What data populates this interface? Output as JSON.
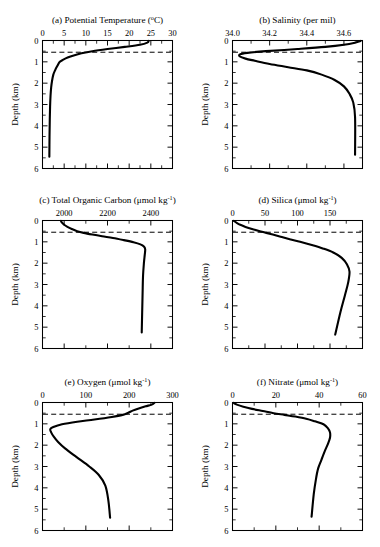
{
  "figure": {
    "axis_label_y": "Depth (km)",
    "depth_unit": "km",
    "depth_ticks": [
      "0",
      "1",
      "2",
      "3",
      "4",
      "5",
      "6"
    ],
    "mixed_layer_dashed_depth_km": 0.55
  },
  "chart_data": [
    {
      "type": "line",
      "panel": "a",
      "title": "(a) Potential Temperature (°C)",
      "title_prefix": "(a) Potential Temperature (",
      "title_unit_base": "o",
      "title_suffix": "C)",
      "xlabel": "Potential Temperature (°C)",
      "ylabel": "Depth (km)",
      "xlim": [
        0,
        30
      ],
      "ylim": [
        6,
        0
      ],
      "xticks": [
        0,
        5,
        10,
        15,
        20,
        25,
        30
      ],
      "xtick_labels": [
        "0",
        "5",
        "10",
        "15",
        "20",
        "25",
        "30"
      ],
      "yticks": [
        0,
        1,
        2,
        3,
        4,
        5,
        6
      ],
      "grid": false,
      "legend": "none",
      "x": [
        24.5,
        24.2,
        22.5,
        19.0,
        15.0,
        11.5,
        9.0,
        7.2,
        5.8,
        4.8,
        4.0,
        3.4,
        2.9,
        2.5,
        2.2,
        2.0,
        1.85,
        1.75,
        1.68,
        1.62,
        1.58
      ],
      "depth_km": [
        0.02,
        0.1,
        0.2,
        0.3,
        0.4,
        0.5,
        0.6,
        0.7,
        0.8,
        0.9,
        1.0,
        1.2,
        1.4,
        1.6,
        1.9,
        2.2,
        2.6,
        3.1,
        3.7,
        4.5,
        5.45
      ]
    },
    {
      "type": "line",
      "panel": "b",
      "title": "(b) Salinity (per mil)",
      "title_prefix": "(b) Salinity (per mil)",
      "xlabel": "Salinity (per mil)",
      "ylabel": "Depth (km)",
      "xlim": [
        34.0,
        34.7
      ],
      "ylim": [
        6,
        0
      ],
      "xticks": [
        34.0,
        34.2,
        34.4,
        34.6
      ],
      "xtick_labels": [
        "34.0",
        "34.2",
        "34.4",
        "34.6"
      ],
      "yticks": [
        0,
        1,
        2,
        3,
        4,
        5,
        6
      ],
      "grid": false,
      "legend": "none",
      "x": [
        34.69,
        34.66,
        34.6,
        34.5,
        34.35,
        34.18,
        34.08,
        34.04,
        34.04,
        34.07,
        34.12,
        34.2,
        34.3,
        34.4,
        34.48,
        34.55,
        34.6,
        34.63,
        34.65,
        34.66,
        34.66
      ],
      "depth_km": [
        0.02,
        0.1,
        0.2,
        0.3,
        0.4,
        0.5,
        0.58,
        0.65,
        0.75,
        0.85,
        0.95,
        1.1,
        1.25,
        1.4,
        1.6,
        1.85,
        2.15,
        2.5,
        2.9,
        3.6,
        5.35
      ]
    },
    {
      "type": "line",
      "panel": "c",
      "title": "(c) Total Organic Carbon (μmol kg⁻¹)",
      "title_prefix": "(c) Total Organic Carbon (μmol kg",
      "title_sup": "-1",
      "title_suffix": ")",
      "xlabel": "Total Organic Carbon (μmol kg⁻¹)",
      "ylabel": "Depth (km)",
      "xlim": [
        1900,
        2500
      ],
      "ylim": [
        6,
        0
      ],
      "xticks": [
        2000,
        2200,
        2400
      ],
      "xtick_labels": [
        "2000",
        "2200",
        "2400"
      ],
      "yticks": [
        0,
        1,
        2,
        3,
        4,
        5,
        6
      ],
      "grid": false,
      "legend": "none",
      "x": [
        1985,
        1990,
        2000,
        2015,
        2035,
        2060,
        2090,
        2130,
        2175,
        2225,
        2275,
        2320,
        2352,
        2368,
        2374,
        2372,
        2368,
        2364,
        2362,
        2360,
        2358
      ],
      "depth_km": [
        0.02,
        0.1,
        0.2,
        0.3,
        0.4,
        0.5,
        0.58,
        0.66,
        0.74,
        0.82,
        0.92,
        1.02,
        1.12,
        1.22,
        1.35,
        1.6,
        2.0,
        2.6,
        3.4,
        4.3,
        5.25
      ]
    },
    {
      "type": "line",
      "panel": "d",
      "title": "(d) Silica (μmol kg⁻¹)",
      "title_prefix": "(d) Silica (μmol kg",
      "title_sup": "-1",
      "title_suffix": ")",
      "xlabel": "Silica (μmol kg⁻¹)",
      "ylabel": "Depth (km)",
      "xlim": [
        0,
        200
      ],
      "ylim": [
        6,
        0
      ],
      "xticks": [
        0,
        50,
        100,
        150
      ],
      "xtick_labels": [
        "0",
        "50",
        "100",
        "150"
      ],
      "yticks": [
        0,
        1,
        2,
        3,
        4,
        5,
        6
      ],
      "grid": false,
      "legend": "none",
      "x": [
        2,
        6,
        12,
        20,
        30,
        42,
        52,
        62,
        74,
        88,
        104,
        122,
        140,
        155,
        168,
        176,
        180,
        178,
        173,
        166,
        158
      ],
      "depth_km": [
        0.02,
        0.1,
        0.2,
        0.3,
        0.4,
        0.5,
        0.58,
        0.66,
        0.76,
        0.88,
        1.0,
        1.15,
        1.32,
        1.5,
        1.75,
        2.05,
        2.4,
        2.9,
        3.5,
        4.3,
        5.35
      ]
    },
    {
      "type": "line",
      "panel": "e",
      "title": "(e) Oxygen (μmol kg⁻¹)",
      "title_prefix": "(e) Oxygen (μmol kg",
      "title_sup": "-1",
      "title_suffix": ")",
      "xlabel": "Oxygen (μmol kg⁻¹)",
      "ylabel": "Depth (km)",
      "xlim": [
        0,
        300
      ],
      "ylim": [
        6,
        0
      ],
      "xticks": [
        0,
        100,
        200,
        300
      ],
      "xtick_labels": [
        "0",
        "100",
        "200",
        "300"
      ],
      "yticks": [
        0,
        1,
        2,
        3,
        4,
        5,
        6
      ],
      "grid": false,
      "legend": "none",
      "x": [
        258,
        252,
        238,
        222,
        208,
        198,
        185,
        160,
        120,
        80,
        45,
        25,
        18,
        20,
        26,
        36,
        52,
        78,
        108,
        130,
        145,
        152,
        156
      ],
      "depth_km": [
        0.02,
        0.1,
        0.18,
        0.28,
        0.38,
        0.48,
        0.58,
        0.68,
        0.8,
        0.9,
        1.02,
        1.15,
        1.25,
        1.4,
        1.6,
        1.85,
        2.15,
        2.55,
        3.0,
        3.4,
        3.9,
        4.6,
        5.4
      ]
    },
    {
      "type": "line",
      "panel": "f",
      "title": "(f) Nitrate (μmol kg⁻¹)",
      "title_prefix": "(f) Nitrate (μmol kg",
      "title_sup": "-1",
      "title_suffix": ")",
      "xlabel": "Nitrate (μmol kg⁻¹)",
      "ylabel": "Depth (km)",
      "xlim": [
        0,
        60
      ],
      "ylim": [
        6,
        0
      ],
      "xticks": [
        0,
        20,
        40,
        60
      ],
      "xtick_labels": [
        "0",
        "20",
        "40",
        "60"
      ],
      "yticks": [
        0,
        1,
        2,
        3,
        4,
        5,
        6
      ],
      "grid": false,
      "legend": "none",
      "x": [
        0.5,
        2,
        5,
        9,
        14,
        19,
        24,
        29,
        34,
        38,
        42,
        44,
        45,
        45,
        44,
        42.5,
        41,
        39.5,
        38.5,
        37.5,
        36.5
      ],
      "depth_km": [
        0.02,
        0.1,
        0.2,
        0.3,
        0.4,
        0.5,
        0.58,
        0.66,
        0.76,
        0.88,
        1.02,
        1.2,
        1.4,
        1.65,
        1.95,
        2.3,
        2.7,
        3.1,
        3.6,
        4.3,
        5.35
      ]
    }
  ]
}
